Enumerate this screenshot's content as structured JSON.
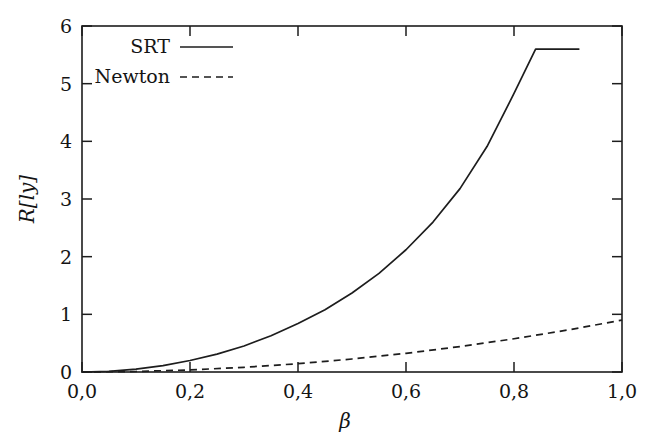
{
  "chart_data": {
    "type": "line",
    "title": "",
    "subtitle": "",
    "xlabel": "β",
    "ylabel": "R[ly]",
    "xlim": [
      0.0,
      1.0
    ],
    "ylim": [
      0.0,
      6.0
    ],
    "grid": false,
    "legend_position": "top-left inside axes",
    "decimal_separator": "comma",
    "x_ticks": [
      0.0,
      0.2,
      0.4,
      0.6,
      0.8,
      1.0
    ],
    "x_tick_labels": [
      "0,0",
      "0,2",
      "0,4",
      "0,6",
      "0,8",
      "1,0"
    ],
    "y_ticks": [
      0,
      1,
      2,
      3,
      4,
      5,
      6
    ],
    "y_tick_labels": [
      "0",
      "1",
      "2",
      "3",
      "4",
      "5",
      "6"
    ],
    "series": [
      {
        "name": "SRT",
        "style": "solid",
        "color": "#1d1d1d",
        "x": [
          0.0,
          0.05,
          0.1,
          0.15,
          0.2,
          0.25,
          0.3,
          0.35,
          0.4,
          0.45,
          0.5,
          0.55,
          0.6,
          0.65,
          0.7,
          0.75,
          0.8,
          0.84,
          0.86,
          0.88,
          0.9,
          0.91,
          0.92
        ],
        "y": [
          0.0,
          0.0022,
          0.0088,
          0.0199,
          0.0356,
          0.0561,
          0.0817,
          0.1129,
          0.1501,
          0.1942,
          0.2462,
          0.3075,
          0.3801,
          0.4668,
          0.5718,
          0.7016,
          0.8677,
          1.0413,
          1.1452,
          1.2688,
          1.4194,
          1.5093,
          1.6129
        ],
        "y_rendered": [
          0.0,
          0.01,
          0.05,
          0.11,
          0.2,
          0.31,
          0.45,
          0.63,
          0.84,
          1.08,
          1.37,
          1.71,
          2.12,
          2.6,
          3.18,
          3.91,
          4.83,
          5.6,
          5.6,
          5.6,
          5.6,
          5.6,
          5.6
        ],
        "endpoint": {
          "x": 0.92,
          "y": 5.6
        },
        "note": "relativistic curve, diverges as beta approaches 1; drawn up to beta = 0.92 where R = 5.6"
      },
      {
        "name": "Newton",
        "style": "dashed",
        "color": "#1d1d1d",
        "x": [
          0.0,
          0.1,
          0.2,
          0.3,
          0.4,
          0.5,
          0.6,
          0.7,
          0.8,
          0.9,
          1.0
        ],
        "y": [
          0.0,
          0.009,
          0.036,
          0.081,
          0.144,
          0.225,
          0.324,
          0.441,
          0.576,
          0.729,
          0.9
        ],
        "endpoint": {
          "x": 1.0,
          "y": 0.9
        },
        "note": "newtonian curve, approximately quadratic in beta, reaching R = 0.9 at beta = 1,0"
      }
    ]
  },
  "legend": {
    "entries": [
      {
        "label": "SRT",
        "sample": "solid-line-sample"
      },
      {
        "label": "Newton",
        "sample": "dashed-line-sample"
      }
    ]
  },
  "axes": {
    "x_label": "β",
    "y_label": "R[ly]",
    "x_tick_labels": [
      "0,0",
      "0,2",
      "0,4",
      "0,6",
      "0,8",
      "1,0"
    ],
    "y_tick_labels": [
      "0",
      "1",
      "2",
      "3",
      "4",
      "5",
      "6"
    ]
  },
  "colors": {
    "foreground": "#1d1d1d",
    "background": "#ffffff"
  }
}
